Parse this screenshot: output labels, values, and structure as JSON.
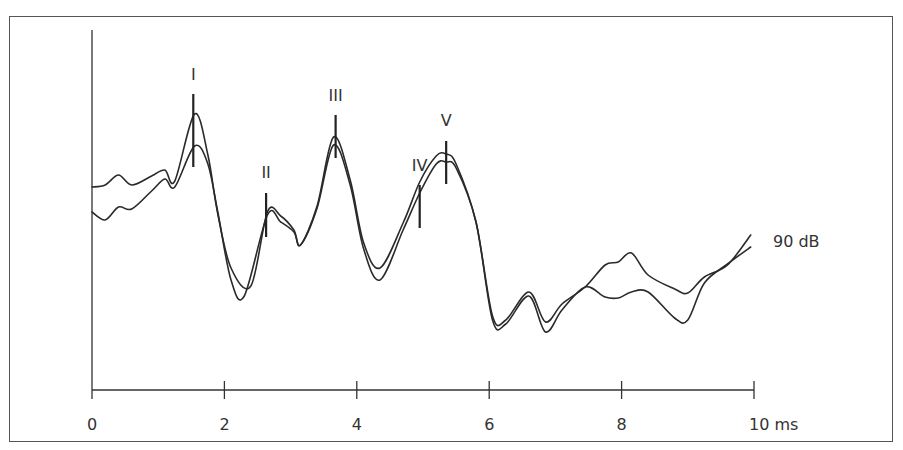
{
  "chart_data": {
    "type": "line",
    "title": "",
    "xlabel": "ms",
    "ylabel": "",
    "xlim": [
      0,
      10
    ],
    "x_ticks": [
      0,
      2,
      4,
      6,
      8,
      10
    ],
    "x_tick_labels": [
      "0",
      "2",
      "4",
      "6",
      "8",
      "10 ms"
    ],
    "grid": false,
    "y_axis_labeled": false,
    "amplitude_units": "relative (arbitrary)",
    "series_label": "90 dB",
    "series": [
      {
        "name": "trace-1",
        "x": [
          0.0,
          0.2,
          0.4,
          0.6,
          0.9,
          1.1,
          1.25,
          1.55,
          1.75,
          1.9,
          2.1,
          2.4,
          2.65,
          2.85,
          3.05,
          3.15,
          3.4,
          3.65,
          3.9,
          4.1,
          4.35,
          4.7,
          4.95,
          5.2,
          5.35,
          5.5,
          5.8,
          6.05,
          6.25,
          6.6,
          6.85,
          7.1,
          7.45,
          7.75,
          7.95,
          8.15,
          8.4,
          8.8,
          9.0,
          9.25,
          9.6,
          9.95
        ],
        "y": [
          203,
          205,
          215,
          205,
          214,
          220,
          209,
          276,
          235,
          176,
          122,
          104,
          178,
          174,
          160,
          145,
          184,
          253,
          210,
          148,
          122,
          167,
          208,
          234,
          236,
          226,
          168,
          74,
          70,
          98,
          68,
          86,
          103,
          125,
          128,
          137,
          115,
          101,
          97,
          113,
          125,
          155
        ]
      },
      {
        "name": "trace-2",
        "x": [
          0.0,
          0.2,
          0.4,
          0.6,
          0.9,
          1.1,
          1.25,
          1.55,
          1.75,
          1.9,
          2.1,
          2.3,
          2.65,
          2.85,
          3.05,
          3.15,
          3.4,
          3.65,
          3.9,
          4.1,
          4.35,
          4.7,
          4.95,
          5.2,
          5.35,
          5.5,
          5.8,
          6.05,
          6.25,
          6.6,
          6.85,
          7.1,
          7.45,
          7.75,
          7.95,
          8.15,
          8.4,
          8.8,
          9.0,
          9.25,
          9.6,
          9.95
        ],
        "y": [
          178,
          170,
          183,
          181,
          199,
          211,
          203,
          244,
          226,
          178,
          110,
          94,
          175,
          168,
          158,
          145,
          182,
          245,
          205,
          142,
          110,
          160,
          197,
          226,
          228,
          222,
          168,
          70,
          66,
          94,
          58,
          80,
          103,
          93,
          92,
          98,
          98,
          72,
          70,
          107,
          126,
          143
        ]
      }
    ],
    "peaks": [
      {
        "label": "I",
        "x_ms": 1.53
      },
      {
        "label": "II",
        "x_ms": 2.63
      },
      {
        "label": "III",
        "x_ms": 3.68
      },
      {
        "label": "IV",
        "x_ms": 4.95
      },
      {
        "label": "V",
        "x_ms": 5.35
      }
    ]
  },
  "annotations": {
    "intensity_label": "90 dB",
    "peak_labels": [
      "I",
      "II",
      "III",
      "IV",
      "V"
    ]
  },
  "axis": {
    "tick_labels": [
      "0",
      "2",
      "4",
      "6",
      "8",
      "10 ms"
    ]
  }
}
